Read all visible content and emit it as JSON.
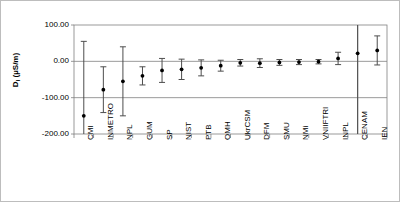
{
  "chart_data": {
    "type": "scatter",
    "title": "",
    "xlabel": "",
    "ylabel": "D1 (µS/m)",
    "ylabel_base": "D",
    "ylabel_sub": "l",
    "ylabel_units": " (µS/m)",
    "ylim": [
      -200,
      100
    ],
    "yticks": [
      100,
      0,
      -100,
      -200
    ],
    "ytick_labels": [
      "100.00",
      "0.00",
      "-100.00",
      "-200.00"
    ],
    "grid": "horizontal-at-zero-and-minus-100",
    "legend": "none",
    "reference_line_category": "CENAM",
    "categories": [
      "CMI",
      "INMETRO",
      "NPL",
      "GUM",
      "SP",
      "NIST",
      "PTB",
      "OMH",
      "UkrCSM",
      "DFM",
      "SMU",
      "NMi",
      "VNIIFTRI",
      "INPL",
      "CENAM",
      "IEN"
    ],
    "values": [
      -150,
      -78,
      -55,
      -40,
      -25,
      -22,
      -18,
      -12,
      -4,
      -5,
      -3,
      -2,
      -1,
      8,
      22,
      30
    ],
    "errors": [
      205,
      63,
      95,
      25,
      33,
      28,
      22,
      15,
      9,
      12,
      8,
      7,
      6,
      17,
      230,
      40
    ],
    "series": [
      {
        "name": "D1",
        "points": [
          {
            "category": "CMI",
            "value": -150,
            "error": 205,
            "lower": -355,
            "upper": 55
          },
          {
            "category": "INMETRO",
            "value": -78,
            "error": 63,
            "lower": -141,
            "upper": -15
          },
          {
            "category": "NPL",
            "value": -55,
            "error": 95,
            "lower": -150,
            "upper": 40
          },
          {
            "category": "GUM",
            "value": -40,
            "error": 25,
            "lower": -65,
            "upper": -15
          },
          {
            "category": "SP",
            "value": -25,
            "error": 33,
            "lower": -58,
            "upper": 8
          },
          {
            "category": "NIST",
            "value": -22,
            "error": 28,
            "lower": -50,
            "upper": 6
          },
          {
            "category": "PTB",
            "value": -18,
            "error": 22,
            "lower": -40,
            "upper": 4
          },
          {
            "category": "OMH",
            "value": -12,
            "error": 15,
            "lower": -27,
            "upper": 3
          },
          {
            "category": "UkrCSM",
            "value": -4,
            "error": 9,
            "lower": -13,
            "upper": 5
          },
          {
            "category": "DFM",
            "value": -5,
            "error": 12,
            "lower": -17,
            "upper": 7
          },
          {
            "category": "SMU",
            "value": -3,
            "error": 8,
            "lower": -11,
            "upper": 5
          },
          {
            "category": "NMi",
            "value": -2,
            "error": 7,
            "lower": -9,
            "upper": 5
          },
          {
            "category": "VNIIFTRI",
            "value": -1,
            "error": 6,
            "lower": -7,
            "upper": 5
          },
          {
            "category": "INPL",
            "value": 8,
            "error": 17,
            "lower": -9,
            "upper": 25
          },
          {
            "category": "CENAM",
            "value": 22,
            "error": 230,
            "lower": -208,
            "upper": 252
          },
          {
            "category": "IEN",
            "value": 30,
            "error": 40,
            "lower": -10,
            "upper": 70
          }
        ]
      }
    ],
    "colors": {
      "marker": "#000000",
      "errorbar": "#4d4d4d",
      "axis": "#808080",
      "gridline": "#808080",
      "frame": "#bdbdbd",
      "text": "#000000"
    }
  }
}
